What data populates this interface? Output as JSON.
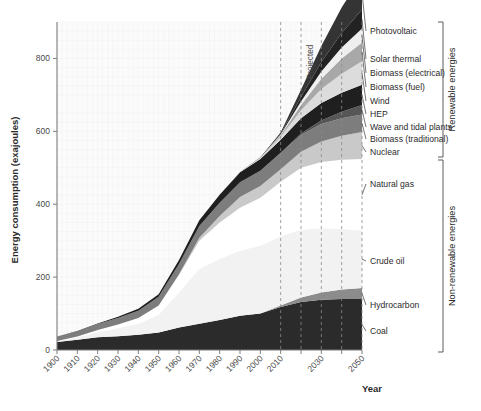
{
  "chart_data": {
    "type": "area",
    "title": "",
    "xlabel": "Year",
    "ylabel": "Energy consumption (exajoules)",
    "xlim": [
      1900,
      2050
    ],
    "ylim": [
      0,
      900
    ],
    "yticks": [
      0,
      200,
      400,
      600,
      800
    ],
    "xticks": [
      1900,
      1910,
      1920,
      1930,
      1940,
      1950,
      1960,
      1970,
      1980,
      1990,
      2000,
      2010,
      2020,
      2030,
      2040,
      2050
    ],
    "xtick_labels": [
      "1900",
      "1910",
      "1920",
      "1930",
      "1940",
      "1950",
      "1960",
      "1970",
      "1980",
      "1990",
      "2000",
      "2010",
      "2020",
      "2030",
      "2040",
      "2050"
    ],
    "xtick_labels_shown": [
      "1900",
      "1910",
      "1920",
      "1930",
      "1940",
      "1950",
      "1960",
      "1970",
      "1980",
      "1990",
      "2000",
      "2010",
      "2030",
      "2050"
    ],
    "grid": true,
    "legend_position": "right",
    "projected_label": "Projected",
    "projected_start_year": 2010,
    "projected_gridline_years": [
      2010,
      2020,
      2030,
      2040,
      2050
    ],
    "x": [
      1900,
      1910,
      1920,
      1930,
      1940,
      1950,
      1960,
      1970,
      1980,
      1990,
      2000,
      2010,
      2020,
      2030,
      2040,
      2050
    ],
    "series": [
      {
        "name": "Coal",
        "group": "non-renewable",
        "color": "#2b2b2b",
        "values": [
          22,
          28,
          35,
          38,
          42,
          48,
          62,
          72,
          82,
          94,
          100,
          118,
          132,
          138,
          140,
          140
        ]
      },
      {
        "name": "Hydrocarbon",
        "group": "non-renewable",
        "color": "#8c8c8c",
        "values": [
          0,
          0,
          0,
          0,
          0,
          0,
          0,
          0,
          0,
          0,
          0,
          4,
          12,
          20,
          26,
          30
        ]
      },
      {
        "name": "Crude oil",
        "group": "non-renewable",
        "color": "#f2f2f2",
        "values": [
          2,
          6,
          14,
          22,
          30,
          48,
          96,
          150,
          168,
          178,
          186,
          190,
          186,
          176,
          166,
          158
        ]
      },
      {
        "name": "Natural gas",
        "group": "non-renewable",
        "color": "#ffffff",
        "values": [
          1,
          3,
          6,
          10,
          16,
          26,
          48,
          78,
          100,
          118,
          132,
          150,
          170,
          182,
          190,
          196
        ]
      },
      {
        "name": "Nuclear",
        "group": "non-renewable",
        "color": "#c9c9c9",
        "values": [
          0,
          0,
          0,
          0,
          0,
          0,
          2,
          8,
          18,
          30,
          32,
          34,
          44,
          56,
          66,
          74
        ]
      },
      {
        "name": "Biomass (traditional)",
        "group": "renewable",
        "color": "#7d7d7d",
        "values": [
          12,
          14,
          16,
          18,
          20,
          24,
          28,
          32,
          36,
          40,
          42,
          44,
          46,
          48,
          48,
          48
        ]
      },
      {
        "name": "Wave and tidal plants",
        "group": "renewable",
        "color": "#565656",
        "values": [
          0,
          0,
          0,
          0,
          0,
          0,
          0,
          0,
          0,
          0,
          0,
          1,
          4,
          10,
          18,
          26
        ]
      },
      {
        "name": "HEP",
        "group": "renewable",
        "color": "#1f1f1f",
        "values": [
          0,
          1,
          2,
          3,
          5,
          7,
          11,
          16,
          22,
          28,
          32,
          36,
          42,
          48,
          52,
          56
        ]
      },
      {
        "name": "Wind",
        "group": "renewable",
        "color": "#dcdcdc",
        "values": [
          0,
          0,
          0,
          0,
          0,
          0,
          0,
          0,
          0,
          1,
          3,
          8,
          22,
          38,
          52,
          64
        ]
      },
      {
        "name": "Biomass (fuel)",
        "group": "renewable",
        "color": "#a8a8a8",
        "values": [
          0,
          0,
          0,
          0,
          0,
          0,
          0,
          0,
          0,
          0,
          1,
          4,
          14,
          28,
          42,
          52
        ]
      },
      {
        "name": "Biomass (electrical)",
        "group": "renewable",
        "color": "#efefef",
        "values": [
          0,
          0,
          0,
          0,
          0,
          0,
          0,
          0,
          0,
          0,
          0,
          2,
          10,
          20,
          30,
          38
        ]
      },
      {
        "name": "Solar thermal",
        "group": "renewable",
        "color": "#232323",
        "values": [
          0,
          0,
          0,
          0,
          0,
          0,
          0,
          0,
          0,
          0,
          0,
          2,
          12,
          26,
          40,
          52
        ]
      },
      {
        "name": "Photovoltaic",
        "group": "renewable",
        "color": "#343434",
        "values": [
          0,
          0,
          0,
          0,
          0,
          0,
          0,
          0,
          0,
          0,
          1,
          4,
          20,
          44,
          70,
          92
        ]
      }
    ]
  },
  "legend": {
    "items": [
      {
        "label": "Photovoltaic",
        "y": 31
      },
      {
        "label": "Solar thermal",
        "y": 59
      },
      {
        "label": "Biomass (electrical)",
        "y": 73
      },
      {
        "label": "Biomass (fuel)",
        "y": 87
      },
      {
        "label": "Wind",
        "y": 101
      },
      {
        "label": "HEP",
        "y": 114
      },
      {
        "label": "Wave and tidal plants",
        "y": 127
      },
      {
        "label": "Biomass (traditional)",
        "y": 139
      },
      {
        "label": "Nuclear",
        "y": 152
      },
      {
        "label": "Natural gas",
        "y": 184
      },
      {
        "label": "Crude oil",
        "y": 261
      },
      {
        "label": "Hydrocarbon",
        "y": 305
      },
      {
        "label": "Coal",
        "y": 331
      }
    ]
  },
  "brackets": {
    "renewable": "Renewable energies",
    "non_renewable": "Non-renewable energies"
  },
  "axes": {
    "y_title": "Energy consumption (exajoules)",
    "x_title": "Year",
    "y_ticks": [
      "0",
      "200",
      "400",
      "600",
      "800"
    ],
    "x_ticks": [
      "1900",
      "1910",
      "1920",
      "1930",
      "1940",
      "1950",
      "1960",
      "1970",
      "1980",
      "1990",
      "2000",
      "2010",
      "2030",
      "2050"
    ]
  },
  "annotations": {
    "projected": "Projected"
  }
}
